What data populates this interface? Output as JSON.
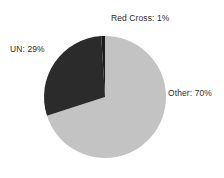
{
  "chart_data": {
    "type": "pie",
    "title": "",
    "categories": [
      "Red Cross",
      "UN",
      "Other"
    ],
    "values": [
      1,
      29,
      70
    ],
    "labels": [
      "Red Cross: 1%",
      "UN: 29%",
      "Other: 70%"
    ],
    "units": "percent",
    "total": 100,
    "legend": "none",
    "grid": false,
    "colors": {
      "red_cross": "#1c1c1c",
      "un": "#2b2b2b",
      "other": "#c3c3c3",
      "background": "#ffffff",
      "label_text": "#2e2e2e"
    },
    "geometry": {
      "center_x": 105,
      "center_y": 97,
      "radius": 61,
      "start_angle_deg": 0,
      "direction": "counterclockwise"
    },
    "slices": [
      {
        "name": "Red Cross",
        "label": "Red Cross: 1%",
        "value": 1,
        "color": "#1c1c1c",
        "label_position": "top"
      },
      {
        "name": "UN",
        "label": "UN: 29%",
        "value": 29,
        "color": "#2b2b2b",
        "label_position": "left"
      },
      {
        "name": "Other",
        "label": "Other: 70%",
        "value": 70,
        "color": "#c3c3c3",
        "label_position": "right"
      }
    ]
  }
}
